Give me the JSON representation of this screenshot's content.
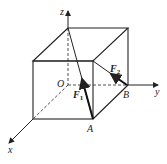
{
  "diagram": {
    "type": "cube-force-diagram",
    "axes": {
      "x": "x",
      "y": "y",
      "z": "z"
    },
    "points": {
      "origin": "O",
      "A": "A",
      "B": "B"
    },
    "forces": {
      "F1": {
        "label": "F",
        "subscript": "1"
      },
      "F2": {
        "label": "F",
        "subscript": "2"
      }
    },
    "colors": {
      "line": "#222222",
      "background": "#ffffff"
    }
  }
}
